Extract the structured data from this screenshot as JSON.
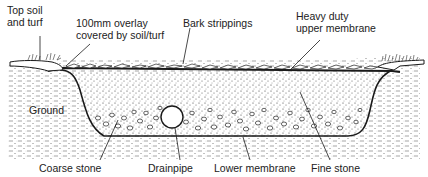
{
  "diagram": {
    "type": "cross-section",
    "labels": {
      "top_soil": "Top soil\nand turf",
      "overlay": "100mm overlay\ncovered by soil/turf",
      "bark": "Bark strippings",
      "upper_membrane": "Heavy duty\nupper membrane",
      "ground": "Ground",
      "coarse_stone": "Coarse stone",
      "drainpipe": "Drainpipe",
      "lower_membrane": "Lower membrane",
      "fine_stone": "Fine stone"
    },
    "colors": {
      "ink": "#1a1a1a",
      "background": "#ffffff"
    }
  }
}
